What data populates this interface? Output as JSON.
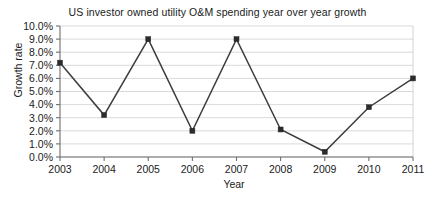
{
  "chart_data": {
    "type": "line",
    "title": "US investor owned utility O&M spending year over year growth",
    "xlabel": "Year",
    "ylabel": "Growth rate",
    "categories": [
      "2003",
      "2004",
      "2005",
      "2006",
      "2007",
      "2008",
      "2009",
      "2010",
      "2011"
    ],
    "x": [
      2003,
      2004,
      2005,
      2006,
      2007,
      2008,
      2009,
      2010,
      2011
    ],
    "values": [
      7.2,
      3.2,
      9.0,
      2.0,
      9.0,
      2.1,
      0.4,
      3.8,
      6.0
    ],
    "series": [
      {
        "name": "Growth rate",
        "values": [
          7.2,
          3.2,
          9.0,
          2.0,
          9.0,
          2.1,
          0.4,
          3.8,
          6.0
        ]
      }
    ],
    "ylim": [
      0.0,
      10.0
    ],
    "ytick_values": [
      0.0,
      1.0,
      2.0,
      3.0,
      4.0,
      5.0,
      6.0,
      7.0,
      8.0,
      9.0,
      10.0
    ],
    "ytick_labels": [
      "0.0%",
      "1.0%",
      "2.0%",
      "3.0%",
      "4.0%",
      "5.0%",
      "6.0%",
      "7.0%",
      "8.0%",
      "9.0%",
      "10.0%"
    ],
    "xtick_labels": [
      "2003",
      "2004",
      "2005",
      "2006",
      "2007",
      "2008",
      "2009",
      "2010",
      "2011"
    ],
    "grid": true,
    "grid_axis": "y",
    "legend": false,
    "legend_position": "none",
    "marker": "square",
    "line_color": "#3d3d3d",
    "marker_color": "#2b2b2b",
    "grid_color": "#d0d0d0",
    "axis_color": "#6e6e6e",
    "background_color": "#ffffff",
    "unit": "%"
  }
}
